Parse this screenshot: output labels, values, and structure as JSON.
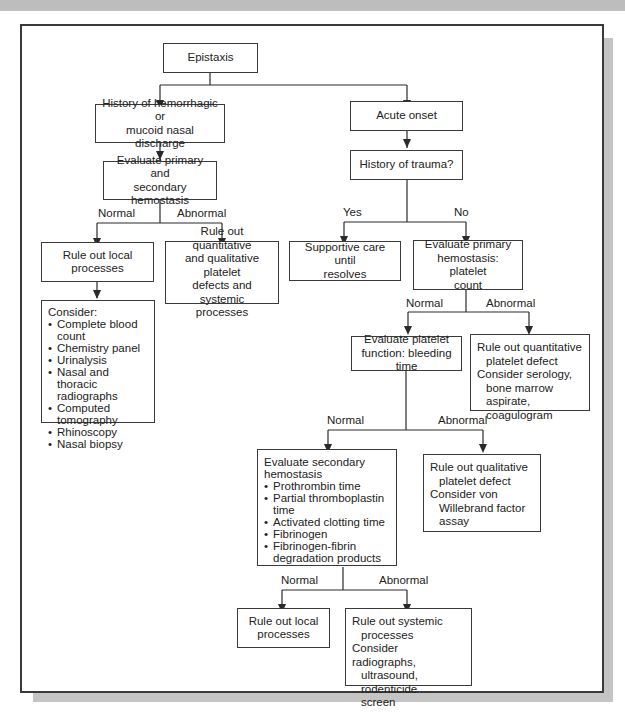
{
  "flowchart": {
    "nodes": {
      "epistaxis": "Epistaxis",
      "history_discharge": "History of hemorrhagic or\nmucoid nasal discharge",
      "eval_primary_secondary": "Evaluate primary and\nsecondary hemostasis",
      "rule_out_local_1": "Rule out local\nprocesses",
      "rule_out_quant_qual": "Rule out quantitative\nand qualitative platelet\ndefects and systemic\nprocesses",
      "consider_list": {
        "heading": "Consider:",
        "items": [
          "Complete blood count",
          "Chemistry panel",
          "Urinalysis",
          "Nasal and thoracic radiographs",
          "Computed tomography",
          "Rhinoscopy",
          "Nasal biopsy"
        ]
      },
      "acute_onset": "Acute onset",
      "history_trauma": "History of trauma?",
      "supportive_care": "Supportive care until\nresolves",
      "eval_primary_platelet": "Evaluate primary\nhemostasis: platelet\ncount",
      "eval_platelet_function": "Evaluate platelet\nfunction: bleeding time",
      "rule_out_quant_defect": {
        "line1": "Rule out quantitative",
        "line2": "platelet defect",
        "line3": "Consider serology,",
        "line4": "bone marrow aspirate,",
        "line5": "coagulogram"
      },
      "eval_secondary": {
        "heading": "Evaluate secondary hemostasis",
        "items": [
          "Prothrombin time",
          "Partial thromboplastin time",
          "Activated clotting time",
          "Fibrinogen",
          "Fibrinogen-fibrin degradation products"
        ]
      },
      "rule_out_qual_defect": {
        "line1": "Rule out qualitative",
        "line2": "platelet defect",
        "line3": "Consider von",
        "line4": "Willebrand factor",
        "line5": "assay"
      },
      "rule_out_local_2": "Rule out local\nprocesses",
      "rule_out_systemic": {
        "line1": "Rule out systemic",
        "line2": "processes",
        "line3": "Consider radiographs,",
        "line4": "ultrasound, rodenticide",
        "line5": "screen"
      }
    },
    "edge_labels": {
      "normal_1": "Normal",
      "abnormal_1": "Abnormal",
      "yes": "Yes",
      "no": "No",
      "normal_2": "Normal",
      "abnormal_2": "Abnormal",
      "normal_3": "Normal",
      "abnormal_3": "Abnormal",
      "normal_4": "Normal",
      "abnormal_4": "Abnormal"
    },
    "colors": {
      "line": "#2a2a2a",
      "frame_border": "#3a3a3a",
      "shadow": "#c4c4c4",
      "top_band": "#bdbdbd"
    }
  }
}
